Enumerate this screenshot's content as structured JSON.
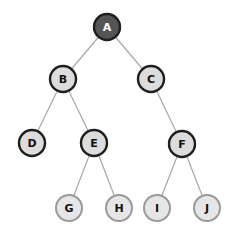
{
  "diagram": {
    "type": "binary-tree",
    "colors": {
      "root_fill": "#555555",
      "root_stroke": "#1e1e1e",
      "root_text": "#ffffff",
      "inner_fill": "#dcdcdc",
      "inner_stroke": "#1e1e1e",
      "leaf_fill": "#e6e6e6",
      "leaf_stroke": "#9a9a9a",
      "text": "#111111",
      "edge": "#a8a8a8"
    },
    "nodes": [
      {
        "id": "A",
        "label": "A",
        "x": 107,
        "y": 27,
        "style": "root"
      },
      {
        "id": "B",
        "label": "B",
        "x": 63,
        "y": 79,
        "style": "inner"
      },
      {
        "id": "C",
        "label": "C",
        "x": 151,
        "y": 79,
        "style": "inner"
      },
      {
        "id": "D",
        "label": "D",
        "x": 32,
        "y": 143,
        "style": "inner"
      },
      {
        "id": "E",
        "label": "E",
        "x": 94,
        "y": 143,
        "style": "inner"
      },
      {
        "id": "F",
        "label": "F",
        "x": 182,
        "y": 144,
        "style": "inner"
      },
      {
        "id": "G",
        "label": "G",
        "x": 69,
        "y": 208,
        "style": "leaf"
      },
      {
        "id": "H",
        "label": "H",
        "x": 119,
        "y": 208,
        "style": "leaf"
      },
      {
        "id": "I",
        "label": "I",
        "x": 157,
        "y": 208,
        "style": "leaf"
      },
      {
        "id": "J",
        "label": "J",
        "x": 207,
        "y": 208,
        "style": "leaf"
      }
    ],
    "edges": [
      [
        "A",
        "B"
      ],
      [
        "A",
        "C"
      ],
      [
        "B",
        "D"
      ],
      [
        "B",
        "E"
      ],
      [
        "C",
        "F"
      ],
      [
        "E",
        "G"
      ],
      [
        "E",
        "H"
      ],
      [
        "F",
        "I"
      ],
      [
        "F",
        "J"
      ]
    ]
  }
}
